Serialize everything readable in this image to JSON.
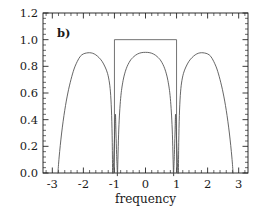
{
  "figure": {
    "panel_label": "b)",
    "background_color": "#ffffff",
    "frame_color": "#1a1a1a",
    "curve_color": "#4a4a4a",
    "boxcar_color": "#5a5a5a"
  },
  "chart_data": {
    "type": "line",
    "title": "",
    "subtitle": "",
    "panel": "b)",
    "xlabel": "frequency",
    "ylabel": "",
    "xlim": [
      -3.3,
      3.3
    ],
    "ylim": [
      0.0,
      1.2
    ],
    "grid": false,
    "legend": null,
    "xticks": [
      -3,
      -2,
      -1,
      0,
      1,
      2,
      3
    ],
    "xticklabels": [
      "-3",
      "-2",
      "-1",
      "0",
      "1",
      "2",
      "3"
    ],
    "yticks": [
      0.0,
      0.2,
      0.4,
      0.6,
      0.8,
      1.0,
      1.2
    ],
    "yticklabels": [
      "0.0",
      "0.2",
      "0.4",
      "0.6",
      "0.8",
      "1.0",
      "1.2"
    ],
    "x_minor_per_major": 5,
    "y_minor_per_major": 5,
    "series": [
      {
        "name": "boxcar",
        "type": "step",
        "description": "rectangular window of unit height between frequency -1 and +1",
        "x": [
          -1.0,
          -1.0,
          1.0,
          1.0
        ],
        "values": [
          0.0,
          1.0,
          1.0,
          0.0
        ],
        "level": 1.0,
        "x_start": -1.0,
        "x_end": 1.0
      },
      {
        "name": "left-lobe",
        "type": "line",
        "peak_x": -1.8,
        "peak_y": 0.9,
        "x": [
          -2.82,
          -2.78,
          -2.7,
          -2.6,
          -2.5,
          -2.4,
          -2.3,
          -2.2,
          -2.1,
          -2.0,
          -1.9,
          -1.8,
          -1.7,
          -1.6,
          -1.5,
          -1.4,
          -1.3,
          -1.22,
          -1.16,
          -1.12,
          -1.09,
          -1.07,
          -1.06
        ],
        "values": [
          0.0,
          0.12,
          0.3,
          0.47,
          0.6,
          0.7,
          0.78,
          0.835,
          0.875,
          0.893,
          0.9,
          0.902,
          0.898,
          0.886,
          0.866,
          0.838,
          0.795,
          0.745,
          0.675,
          0.58,
          0.43,
          0.23,
          0.0
        ]
      },
      {
        "name": "center-lobe",
        "type": "line",
        "peak_x": 0.0,
        "peak_y": 0.905,
        "x": [
          -1.04,
          -1.0,
          -0.97,
          -0.95,
          -0.93,
          -0.91,
          -0.9,
          -0.86,
          -0.8,
          -0.72,
          -0.62,
          -0.5,
          -0.38,
          -0.26,
          -0.14,
          0.0,
          0.14,
          0.26,
          0.38,
          0.5,
          0.62,
          0.72,
          0.8,
          0.86,
          0.9,
          0.91,
          0.93,
          0.95,
          0.97,
          1.0,
          1.04
        ],
        "values": [
          0.0,
          0.25,
          0.44,
          0.3,
          0.14,
          0.02,
          0.0,
          0.33,
          0.56,
          0.695,
          0.782,
          0.84,
          0.872,
          0.892,
          0.902,
          0.905,
          0.902,
          0.892,
          0.872,
          0.84,
          0.782,
          0.695,
          0.56,
          0.33,
          0.0,
          0.02,
          0.14,
          0.3,
          0.44,
          0.25,
          0.0
        ]
      },
      {
        "name": "right-lobe",
        "type": "line",
        "peak_x": 1.8,
        "peak_y": 0.9,
        "x": [
          1.06,
          1.07,
          1.09,
          1.12,
          1.16,
          1.22,
          1.3,
          1.4,
          1.5,
          1.6,
          1.7,
          1.8,
          1.9,
          2.0,
          2.1,
          2.2,
          2.3,
          2.4,
          2.5,
          2.6,
          2.7,
          2.78,
          2.82
        ],
        "values": [
          0.0,
          0.23,
          0.43,
          0.58,
          0.675,
          0.745,
          0.795,
          0.838,
          0.866,
          0.886,
          0.898,
          0.902,
          0.9,
          0.893,
          0.875,
          0.835,
          0.78,
          0.7,
          0.6,
          0.47,
          0.3,
          0.12,
          0.0
        ]
      }
    ],
    "notch_positions": [
      -1.05,
      -0.88,
      0.88,
      1.05
    ],
    "zero_crossings": [
      -2.82,
      2.82
    ]
  }
}
